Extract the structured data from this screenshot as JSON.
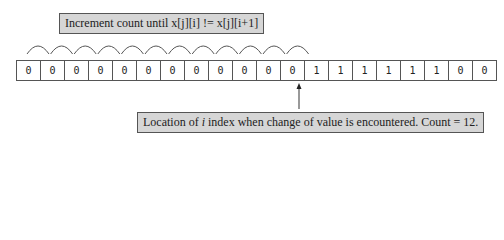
{
  "top_callout": {
    "text": "Increment count until x[j][i] != x[j][i+1]"
  },
  "bottom_callout": {
    "prefix": "Location of ",
    "italic": "i",
    "suffix": " index when change of value is encountered.  Count = 12."
  },
  "array": {
    "values": [
      "0",
      "0",
      "0",
      "0",
      "0",
      "0",
      "0",
      "0",
      "0",
      "0",
      "0",
      "0",
      "1",
      "1",
      "1",
      "1",
      "1",
      "1",
      "0",
      "0"
    ]
  },
  "arcs": {
    "count": 12
  },
  "pointer": {
    "index": 11
  }
}
